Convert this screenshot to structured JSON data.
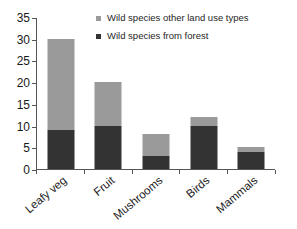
{
  "chart_data": {
    "type": "bar",
    "barmode": "stacked",
    "title": "",
    "xlabel": "",
    "ylabel": "",
    "ylim": [
      0,
      35
    ],
    "ytick_step": 5,
    "yticks": [
      0,
      5,
      10,
      15,
      20,
      25,
      30,
      35
    ],
    "ytick_labels": [
      "0",
      "5",
      "10",
      "15",
      "20",
      "25",
      "30",
      "35"
    ],
    "grid": false,
    "legend_position": "top-right-inside",
    "categories": [
      "Leafy veg",
      "Fruit",
      "Mushrooms",
      "Birds",
      "Mammals"
    ],
    "series": [
      {
        "name": "Wild species from forest",
        "color": "#333333",
        "values": [
          9,
          10,
          3,
          10,
          4
        ]
      },
      {
        "name": "Wild species other land use types",
        "color": "#9a9a9a",
        "values": [
          21,
          10,
          5,
          2,
          1
        ]
      }
    ],
    "totals": [
      30,
      20,
      8,
      12,
      5
    ]
  },
  "legend": {
    "items": [
      {
        "label": "Wild species other land use types",
        "color": "#9a9a9a"
      },
      {
        "label": "Wild species from forest",
        "color": "#333333"
      }
    ]
  },
  "axis": {
    "y_labels": [
      "35",
      "30",
      "25",
      "20",
      "15",
      "10",
      "5",
      "0"
    ],
    "x_labels": [
      "Leafy veg",
      "Fruit",
      "Mushrooms",
      "Birds",
      "Mammals"
    ]
  }
}
